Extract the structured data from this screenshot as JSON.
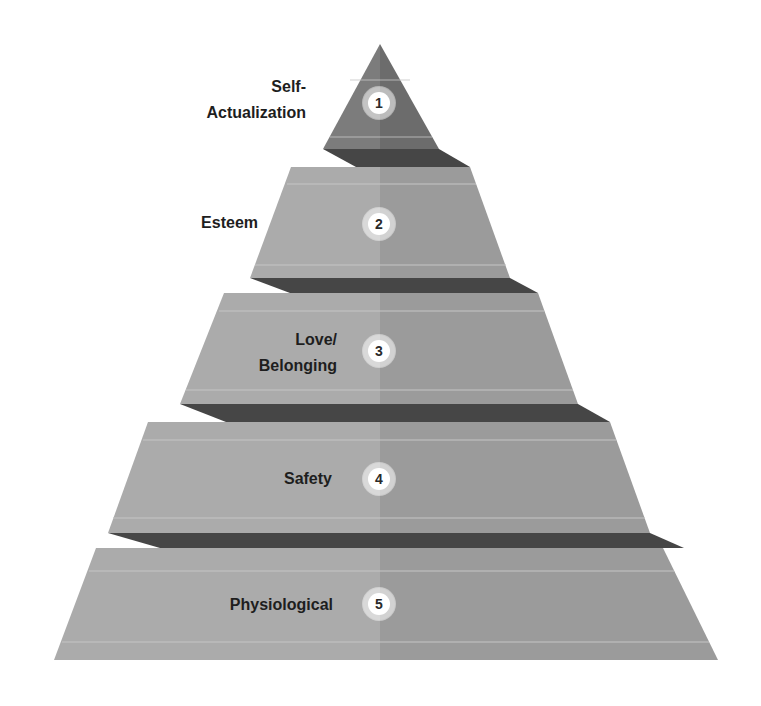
{
  "diagram": {
    "type": "pyramid",
    "colors": {
      "top_left": "#7c7c7c",
      "top_right": "#6c6c6c",
      "tier_left": "#ababab",
      "tier_right": "#9b9b9b",
      "band": "#464646",
      "highlight": "#c4c4c4",
      "label_text": "#1e1e1e",
      "badge_bg": "#ffffff"
    },
    "tiers": [
      {
        "number": "1",
        "label_line1": "Self-",
        "label_line2": "Actualization"
      },
      {
        "number": "2",
        "label_line1": "Esteem",
        "label_line2": ""
      },
      {
        "number": "3",
        "label_line1": "Love/",
        "label_line2": "Belonging"
      },
      {
        "number": "4",
        "label_line1": "Safety",
        "label_line2": ""
      },
      {
        "number": "5",
        "label_line1": "Physiological",
        "label_line2": ""
      }
    ]
  }
}
